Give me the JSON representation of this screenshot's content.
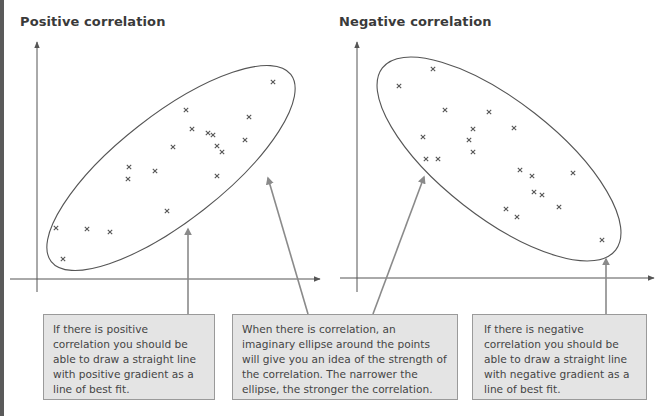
{
  "left_panel": {
    "title": "Positive correlation",
    "marker": "x",
    "points": [
      [
        273,
        82
      ],
      [
        186,
        110
      ],
      [
        249,
        117
      ],
      [
        192,
        129
      ],
      [
        208,
        133
      ],
      [
        213,
        135
      ],
      [
        245,
        140
      ],
      [
        173,
        147
      ],
      [
        217,
        146
      ],
      [
        222,
        152
      ],
      [
        129,
        167
      ],
      [
        155,
        171
      ],
      [
        128,
        179
      ],
      [
        217,
        176
      ],
      [
        167,
        211
      ],
      [
        56,
        228
      ],
      [
        87,
        229
      ],
      [
        110,
        232
      ],
      [
        63,
        259
      ]
    ]
  },
  "right_panel": {
    "title": "Negative correlation",
    "marker": "x",
    "points": [
      [
        433,
        69
      ],
      [
        399,
        86
      ],
      [
        445,
        110
      ],
      [
        489,
        112
      ],
      [
        514,
        128
      ],
      [
        473,
        129
      ],
      [
        423,
        137
      ],
      [
        469,
        140
      ],
      [
        473,
        152
      ],
      [
        426,
        159
      ],
      [
        438,
        159
      ],
      [
        520,
        170
      ],
      [
        573,
        173
      ],
      [
        532,
        176
      ],
      [
        534,
        192
      ],
      [
        542,
        195
      ],
      [
        559,
        207
      ],
      [
        506,
        209
      ],
      [
        517,
        217
      ],
      [
        602,
        240
      ]
    ]
  },
  "callouts": [
    {
      "text": "If there is positive correlation you should be able to draw a straight line with positive gradient as a line of best fit."
    },
    {
      "text": "When there is correlation, an imaginary ellipse around the points will give you an idea of the strength of the correlation. The narrower the ellipse, the stronger the correlation."
    },
    {
      "text": "If there is negative correlation you should be able to draw a straight line with negative gradient as a line of best fit."
    }
  ],
  "colors": {
    "axis": "#555555",
    "ellipse": "#555555",
    "arrow": "#8a8a8a",
    "box_bg": "#e4e4e4",
    "box_border": "#9a9a9a",
    "marker": "#555555"
  },
  "chart_data": [
    {
      "type": "scatter",
      "title": "Positive correlation",
      "xlabel": "",
      "ylabel": "",
      "grid": false,
      "x": [
        9,
        5.6,
        8.2,
        5.8,
        6.4,
        6.6,
        7.9,
        5.1,
        6.8,
        7.0,
        3.4,
        4.4,
        3.4,
        6.8,
        4.9,
        0.7,
        1.9,
        2.8,
        1.0
      ],
      "y": [
        7.8,
        6.6,
        6.3,
        5.8,
        5.6,
        5.5,
        5.3,
        5.0,
        5.0,
        4.8,
        4.2,
        4.0,
        3.7,
        3.8,
        2.5,
        1.9,
        1.9,
        1.7,
        0.8
      ],
      "annotations": [
        "ellipse enclosing points, oriented with positive slope"
      ]
    },
    {
      "type": "scatter",
      "title": "Negative correlation",
      "xlabel": "",
      "ylabel": "",
      "grid": false,
      "x": [
        2.6,
        1.5,
        3.1,
        4.6,
        5.5,
        4.1,
        2.4,
        3.9,
        4.1,
        2.5,
        2.9,
        5.7,
        7.4,
        6.0,
        6.1,
        6.4,
        6.9,
        5.2,
        5.6,
        8.4
      ],
      "y": [
        8.3,
        7.6,
        6.6,
        6.6,
        5.9,
        5.9,
        5.6,
        5.4,
        5.0,
        4.7,
        4.7,
        4.3,
        4.2,
        4.1,
        3.5,
        3.4,
        2.9,
        2.9,
        2.6,
        1.6
      ],
      "annotations": [
        "ellipse enclosing points, oriented with negative slope"
      ]
    }
  ]
}
